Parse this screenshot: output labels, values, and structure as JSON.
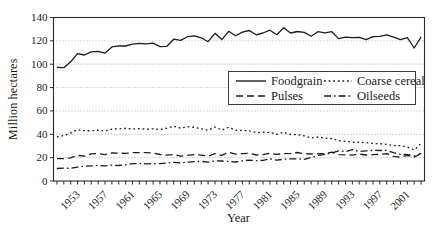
{
  "chart_data": {
    "type": "line",
    "title": "",
    "xlabel": "Year",
    "ylabel": "Million hectares",
    "x_range": [
      1949.5,
      2003.5
    ],
    "ylim": [
      0,
      140
    ],
    "y_ticks": [
      0,
      20,
      40,
      60,
      80,
      100,
      120,
      140
    ],
    "x_tick_labels": [
      "1953",
      "1957",
      "1961",
      "1965",
      "1969",
      "1973",
      "1977",
      "1981",
      "1985",
      "1989",
      "1993",
      "1997",
      "2001"
    ],
    "x_minor_tick_interval": 1,
    "grid": "horizontal dotted lines at each y tick",
    "legend_position": "inside middle-right, boxed, 2 columns",
    "years": [
      1950,
      1951,
      1952,
      1953,
      1954,
      1955,
      1956,
      1957,
      1958,
      1959,
      1960,
      1961,
      1962,
      1963,
      1964,
      1965,
      1966,
      1967,
      1968,
      1969,
      1970,
      1971,
      1972,
      1973,
      1974,
      1975,
      1976,
      1977,
      1978,
      1979,
      1980,
      1981,
      1982,
      1983,
      1984,
      1985,
      1986,
      1987,
      1988,
      1989,
      1990,
      1991,
      1992,
      1993,
      1994,
      1995,
      1996,
      1997,
      1998,
      1999,
      2000,
      2001,
      2002,
      2003
    ],
    "series": [
      {
        "name": "Foodgrain",
        "style": "solid",
        "values": [
          97.3,
          97.0,
          102.1,
          109.1,
          107.9,
          110.6,
          111.1,
          109.5,
          114.8,
          115.8,
          115.6,
          117.2,
          117.8,
          117.4,
          118.1,
          115.1,
          115.3,
          121.4,
          120.4,
          123.6,
          124.3,
          122.6,
          119.3,
          126.5,
          121.1,
          128.2,
          124.4,
          127.5,
          128.9,
          125.2,
          126.7,
          129.1,
          125.3,
          131.2,
          126.7,
          128.0,
          127.2,
          124.0,
          127.8,
          126.8,
          127.8,
          121.9,
          123.2,
          122.8,
          123.0,
          121.0,
          123.6,
          123.9,
          125.2,
          123.1,
          121.1,
          122.8,
          113.9,
          123.5
        ]
      },
      {
        "name": "Coarse cereal",
        "style": "dotted",
        "values": [
          37.7,
          38.9,
          41.3,
          43.9,
          43.1,
          43.0,
          43.5,
          42.8,
          44.4,
          44.6,
          45.0,
          44.6,
          44.8,
          44.4,
          44.7,
          44.1,
          45.2,
          46.9,
          45.3,
          46.6,
          46.0,
          44.7,
          43.4,
          46.2,
          43.7,
          46.0,
          43.5,
          43.3,
          43.0,
          41.4,
          41.8,
          41.6,
          39.9,
          41.7,
          39.8,
          39.7,
          38.7,
          36.8,
          37.7,
          36.7,
          36.3,
          34.5,
          34.0,
          33.2,
          33.1,
          33.0,
          32.1,
          31.9,
          31.4,
          30.3,
          30.3,
          29.0,
          26.7,
          32.1
        ]
      },
      {
        "name": "Pulses",
        "style": "dashed",
        "values": [
          19.1,
          19.1,
          19.9,
          21.9,
          21.2,
          23.2,
          23.5,
          22.6,
          24.1,
          23.9,
          23.6,
          24.2,
          24.3,
          24.2,
          23.9,
          22.7,
          22.1,
          22.7,
          21.3,
          22.0,
          22.5,
          22.2,
          21.3,
          23.4,
          22.0,
          24.5,
          23.0,
          23.5,
          23.7,
          22.3,
          22.5,
          23.8,
          22.8,
          23.5,
          23.6,
          24.4,
          23.2,
          23.1,
          23.2,
          23.4,
          24.7,
          22.5,
          22.4,
          22.2,
          23.0,
          22.3,
          22.5,
          22.9,
          23.5,
          21.1,
          20.3,
          22.0,
          20.5,
          23.5
        ]
      },
      {
        "name": "Oilseeds",
        "style": "dashdot",
        "values": [
          10.7,
          11.0,
          10.9,
          11.9,
          12.6,
          12.9,
          13.4,
          13.0,
          13.6,
          13.3,
          13.8,
          14.8,
          14.8,
          14.7,
          15.0,
          14.9,
          15.3,
          16.0,
          15.6,
          16.1,
          16.6,
          16.8,
          16.2,
          17.3,
          17.1,
          16.9,
          16.3,
          17.3,
          17.8,
          17.4,
          17.6,
          18.9,
          17.8,
          18.7,
          19.0,
          19.0,
          18.6,
          20.1,
          21.9,
          22.8,
          24.1,
          25.9,
          25.2,
          26.9,
          25.3,
          25.8,
          26.3,
          26.1,
          26.2,
          24.3,
          22.8,
          22.6,
          21.5,
          23.7
        ]
      }
    ],
    "colors": {
      "line": "#1c1c1c",
      "axis": "#2b2b2b",
      "grid": "#ababab",
      "background": "#ffffff",
      "legend_border": "#3a3a3a"
    }
  }
}
